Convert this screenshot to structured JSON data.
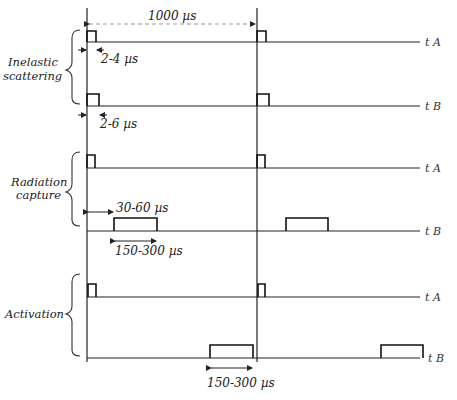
{
  "title_interval": "1000 µs",
  "groups": [
    {
      "label_line1": "Inelastic",
      "label_line2": "scattering",
      "line_a_label": "t  A",
      "line_b_label": "t  B",
      "annotation_a": "2-4 µs",
      "annotation_b": "2-6 µs"
    },
    {
      "label_line1": "Radiation",
      "label_line2": "capture",
      "line_a_label": "t  A",
      "line_b_label": "t  B",
      "annotation_delay": "30-60 µs",
      "annotation_width": "150-300 µs"
    },
    {
      "label_line1": "Activation",
      "label_line2": "",
      "line_a_label": "t  A",
      "line_b_label": "t  B",
      "annotation_width": "150-300 µs"
    }
  ]
}
